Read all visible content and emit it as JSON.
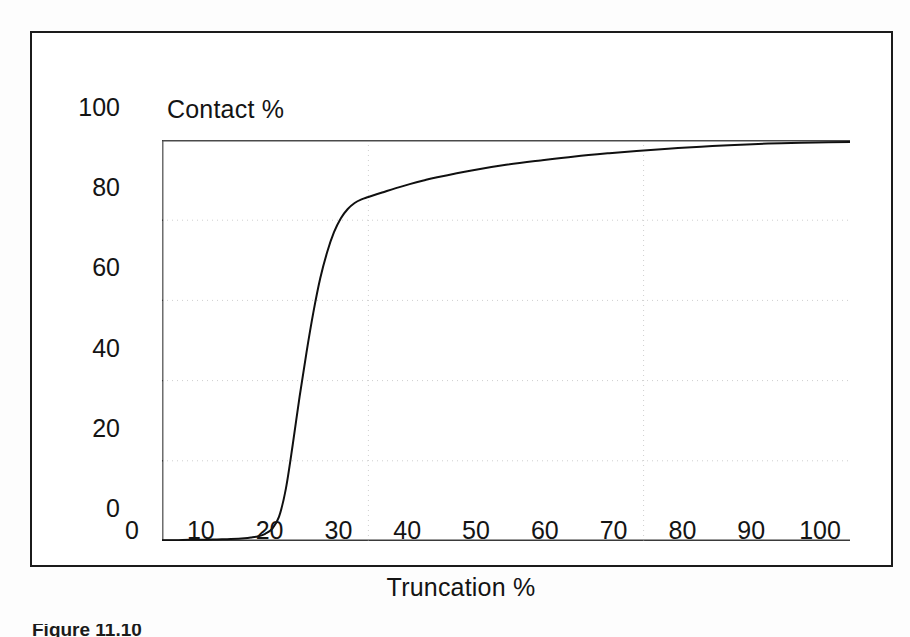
{
  "figure": {
    "caption": "Figure 11.10",
    "frame_color": "#1b1b1b",
    "background": "#ffffff"
  },
  "chart_data": {
    "type": "line",
    "title": "",
    "xlabel": "Truncation %",
    "ylabel": "Contact %",
    "xlim": [
      0,
      100
    ],
    "ylim": [
      0,
      100
    ],
    "xticks": [
      0,
      10,
      20,
      30,
      40,
      50,
      60,
      70,
      80,
      90,
      100
    ],
    "yticks": [
      0,
      20,
      40,
      60,
      80,
      100
    ],
    "xtick_labels": [
      "0",
      "10",
      "20",
      "30",
      "40",
      "50",
      "60",
      "70",
      "80",
      "90",
      "100"
    ],
    "ytick_labels": [
      "0",
      "20",
      "40",
      "60",
      "80",
      "100"
    ],
    "grid": {
      "horizontal": [
        20,
        40,
        60,
        80,
        100
      ],
      "vertical": [
        30,
        70
      ],
      "style": "dotted",
      "color": "#cfcfcf"
    },
    "legend": null,
    "line_color": "#101010",
    "line_width": 2,
    "series": [
      {
        "name": "Contact %",
        "x": [
          0,
          2,
          4,
          6,
          8,
          10,
          12,
          13,
          14,
          15,
          16,
          17,
          18,
          19,
          20,
          21,
          22,
          23,
          24,
          25,
          26,
          27,
          28,
          29,
          30,
          32,
          34,
          36,
          38,
          40,
          45,
          50,
          55,
          60,
          65,
          70,
          75,
          80,
          85,
          90,
          95,
          100
        ],
        "y": [
          0.2,
          0.2,
          0.3,
          0.3,
          0.4,
          0.5,
          0.7,
          0.9,
          1.2,
          1.8,
          3.0,
          6.0,
          13.0,
          24.0,
          36.0,
          47.0,
          57.0,
          65.5,
          72.0,
          77.0,
          80.5,
          82.8,
          84.3,
          85.2,
          85.8,
          86.9,
          88.0,
          89.0,
          89.9,
          90.7,
          92.4,
          93.8,
          94.9,
          95.9,
          96.7,
          97.4,
          98.0,
          98.5,
          98.9,
          99.2,
          99.4,
          99.5
        ]
      }
    ],
    "annotations": {
      "midpoint_truncation": 22,
      "plateau_contact": 99.5,
      "onset_truncation": 16
    }
  }
}
